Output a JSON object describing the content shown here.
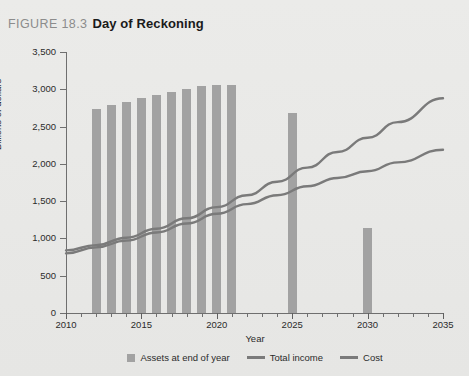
{
  "caption": {
    "figure_number": "FIGURE 18.3",
    "title": "Day of Reckoning"
  },
  "chart_data": {
    "type": "bar",
    "title": "Day of Reckoning",
    "xlabel": "Year",
    "ylabel": "Billions of dollars",
    "xlim": [
      2010,
      2035
    ],
    "ylim": [
      0,
      3500
    ],
    "ytick_labels": [
      "0",
      "500",
      "1,000",
      "1,500",
      "2,000",
      "2,500",
      "3,000",
      "3,500"
    ],
    "ytick_values": [
      0,
      500,
      1000,
      1500,
      2000,
      2500,
      3000,
      3500
    ],
    "xtick_labels": [
      "2010",
      "2015",
      "2020",
      "2025",
      "2030",
      "2035"
    ],
    "xtick_values": [
      2010,
      2015,
      2020,
      2025,
      2030,
      2035
    ],
    "grid": false,
    "legend_position": "bottom",
    "bar_color": "#a2a2a2",
    "line_color": "#7a7a7a",
    "series": [
      {
        "name": "Assets at end of year",
        "type": "bar",
        "x": [
          2012,
          2013,
          2014,
          2015,
          2016,
          2017,
          2018,
          2019,
          2020,
          2021,
          2025,
          2030
        ],
        "values": [
          2730,
          2790,
          2830,
          2880,
          2930,
          2970,
          3010,
          3040,
          3060,
          3060,
          2680,
          1140
        ]
      },
      {
        "name": "Total income",
        "type": "line",
        "x": [
          2010,
          2012,
          2014,
          2016,
          2018,
          2020,
          2022,
          2024,
          2026,
          2028,
          2030,
          2032,
          2035
        ],
        "values": [
          800,
          880,
          970,
          1080,
          1200,
          1330,
          1460,
          1580,
          1700,
          1810,
          1900,
          2020,
          2190
        ]
      },
      {
        "name": "Cost",
        "type": "line",
        "x": [
          2010,
          2012,
          2014,
          2016,
          2018,
          2020,
          2022,
          2024,
          2026,
          2028,
          2030,
          2032,
          2035
        ],
        "values": [
          840,
          910,
          1010,
          1130,
          1270,
          1420,
          1580,
          1760,
          1950,
          2160,
          2350,
          2560,
          2880
        ]
      }
    ]
  },
  "legend": {
    "items": [
      {
        "label": "Assets at end of year",
        "marker": "box",
        "color": "#a2a2a2"
      },
      {
        "label": "Total income",
        "marker": "line",
        "color": "#7a7a7a"
      },
      {
        "label": "Cost",
        "marker": "line",
        "color": "#7a7a7a"
      }
    ]
  }
}
